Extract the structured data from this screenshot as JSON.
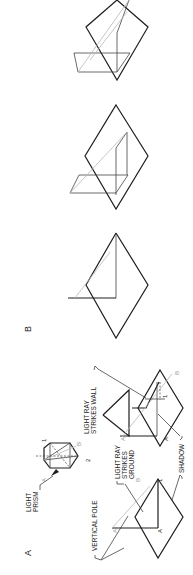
{
  "figure": {
    "orientation": "rotated 90 degrees counterclockwise",
    "panel_a": {
      "label": "A",
      "callouts": {
        "light_prism_1": "LIGHT",
        "light_prism_2": "PRISM",
        "vertical_pole": "VERTICAL POLE",
        "ground_1": "LIGHT RAY",
        "ground_2": "STRIKES",
        "ground_3": "GROUND",
        "wall_1": "LIGHT RAY",
        "wall_2": "STRIKES WALL",
        "shadow": "SHADOW"
      },
      "point_labels": {
        "prism_a": "A",
        "prism_b": "B",
        "prism_1": "1",
        "prism_2": "2",
        "left_a_top": "A",
        "left_a_base": "A",
        "left_b": "B",
        "left_1": "1",
        "right_a_top": "A",
        "right_a_base": "A",
        "right_b": "B",
        "right_1": "1"
      }
    },
    "panel_b": {
      "label": "B",
      "drawings": 3
    }
  }
}
